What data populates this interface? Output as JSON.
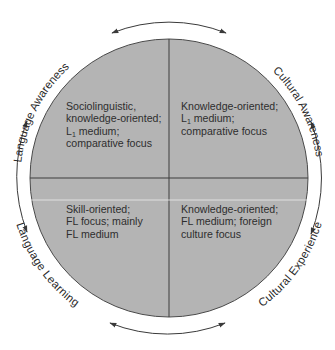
{
  "diagram": {
    "type": "circular-quadrant-model",
    "colors": {
      "fill": "#b4b4b4",
      "stroke": "#4a4a4a",
      "divider": "#3c3c3c",
      "highlight_line": "#e8e8e8",
      "text": "#2e2e2e",
      "arrow": "#3a3a3a",
      "background": "#ffffff"
    },
    "outer_labels": {
      "top_left": "Language Awareness",
      "top_right": "Cultural Awareness",
      "bottom_left": "Language Learning",
      "bottom_right": "Cultural Experience"
    },
    "quadrants": {
      "top_left": {
        "lines": [
          "Sociolinguistic,",
          "knowledge-oriented;",
          "L",
          "1",
          " medium;",
          "comparative focus"
        ],
        "line1": "Sociolinguistic,",
        "line2": "knowledge-oriented;",
        "line3_prefix": "L",
        "line3_sub": "1",
        "line3_suffix": " medium;",
        "line4": "comparative focus"
      },
      "top_right": {
        "line1": "Knowledge-oriented;",
        "line2_prefix": "L",
        "line2_sub": "1",
        "line2_suffix": " medium;",
        "line3": "comparative focus"
      },
      "bottom_left": {
        "line1": "Skill-oriented;",
        "line2": "FL focus; mainly",
        "line3": "FL medium"
      },
      "bottom_right": {
        "line1": "Knowledge-oriented;",
        "line2": "FL medium; foreign",
        "line3": "culture focus"
      }
    },
    "arrows": [
      "top (double-headed)",
      "left (double-headed)",
      "right (double-headed)",
      "bottom (double-headed)"
    ]
  }
}
